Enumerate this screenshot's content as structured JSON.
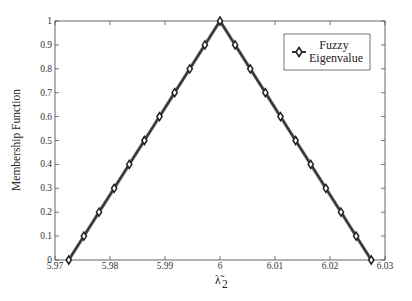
{
  "chart_data": {
    "type": "line",
    "title": "",
    "xlabel": "λ̃2",
    "ylabel": "Membership Function",
    "xlim": [
      5.97,
      6.03
    ],
    "ylim": [
      0,
      1
    ],
    "xticks": [
      "5.97",
      "5.98",
      "5.99",
      "6",
      "6.01",
      "6.02",
      "6.03"
    ],
    "yticks": [
      "0",
      "0.1",
      "0.2",
      "0.3",
      "0.4",
      "0.5",
      "0.6",
      "0.7",
      "0.8",
      "0.9",
      "1"
    ],
    "grid": false,
    "legend_position": "upper right",
    "series": [
      {
        "name": "Fuzzy Eigenvalue",
        "marker": "diamond",
        "color": "#333333",
        "x": [
          5.9725,
          5.97525,
          5.978,
          5.98075,
          5.9835,
          5.98625,
          5.989,
          5.99175,
          5.9945,
          5.99725,
          6.0,
          6.00275,
          6.0055,
          6.00825,
          6.011,
          6.01375,
          6.0165,
          6.01925,
          6.022,
          6.02475,
          6.0275
        ],
        "y": [
          0,
          0.1,
          0.2,
          0.3,
          0.4,
          0.5,
          0.6,
          0.7,
          0.8,
          0.9,
          1.0,
          0.9,
          0.8,
          0.7,
          0.6,
          0.5,
          0.4,
          0.3,
          0.2,
          0.1,
          0
        ]
      }
    ]
  },
  "legend": {
    "line1": "Fuzzy",
    "line2": "Eigenvalue"
  },
  "axes": {
    "xlabel_main": "λ̃",
    "xlabel_sub": "2",
    "ylabel": "Membership Function"
  }
}
